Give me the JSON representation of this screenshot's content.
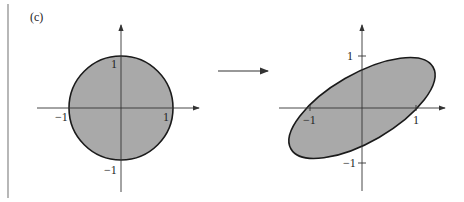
{
  "panel_label": "(c)",
  "left_plot": {
    "shape": "unit circle",
    "tick_labels": {
      "x_neg": "−1",
      "x_pos": "1",
      "y_pos": "1",
      "y_neg": "−1"
    }
  },
  "transform_arrow": "right-arrow",
  "right_plot": {
    "shape": "tilted ellipse",
    "tick_labels": {
      "x_neg": "−1",
      "x_pos": "1",
      "y_pos": "1",
      "y_neg": "−1"
    }
  },
  "colors": {
    "fill": "#a9a9a9",
    "stroke": "#1a1a1a",
    "axis": "#333333"
  }
}
